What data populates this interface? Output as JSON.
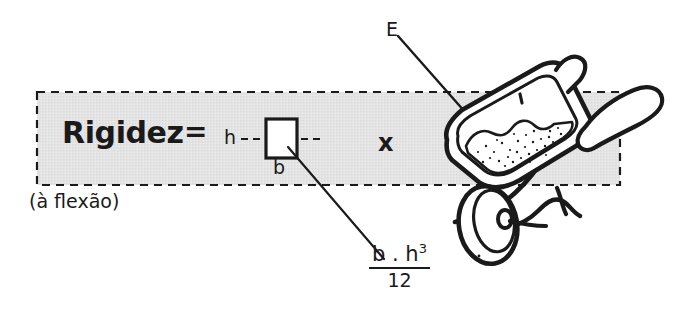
{
  "figure": {
    "title_text": "Rigidez",
    "equals": "=",
    "subtitle": "(à flexão)",
    "multiply": "x",
    "modulus_label": "E",
    "height_label": "h",
    "width_label": "b",
    "formula": {
      "numerator_base": "b . h",
      "numerator_exponent": "3",
      "denominator": "12"
    },
    "illustration": "wheelbarrow-with-sand",
    "colors": {
      "ink": "#1a1a1a",
      "panel_fill": "#e3e3e3",
      "page_background": "#ffffff",
      "dash_stroke": "#1a1a1a"
    }
  }
}
